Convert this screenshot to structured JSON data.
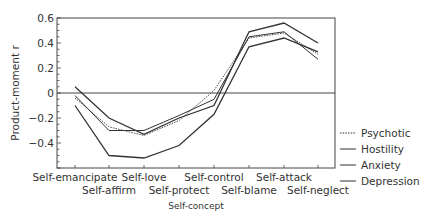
{
  "chart_data": {
    "type": "line",
    "title": "",
    "xlabel": "Self-concept",
    "ylabel": "Product-moment r",
    "ylim": [
      -0.6,
      0.6
    ],
    "yticks": [
      0.6,
      0.4,
      0.2,
      0,
      -0.2,
      -0.4
    ],
    "ytick_labels": [
      "0.6",
      "0.4",
      "0.2",
      "0",
      "−0.2",
      "−0.4"
    ],
    "grid": false,
    "zero_line": true,
    "legend_position": "right",
    "categories": [
      "Self-emancipate",
      "Self-affirm",
      "Self-love",
      "Self-protect",
      "Self-control",
      "Self-blame",
      "Self-attack",
      "Self-neglect"
    ],
    "series": [
      {
        "name": "Psychotic",
        "style": "dotted",
        "values": [
          -0.04,
          -0.27,
          -0.34,
          -0.22,
          0.02,
          0.44,
          0.48,
          0.31
        ]
      },
      {
        "name": "Hostility",
        "style": "solid",
        "values": [
          0.05,
          -0.2,
          -0.33,
          -0.2,
          -0.1,
          0.49,
          0.56,
          0.4
        ]
      },
      {
        "name": "Anxiety",
        "style": "solid",
        "values": [
          -0.02,
          -0.3,
          -0.3,
          -0.18,
          -0.05,
          0.45,
          0.49,
          0.27
        ]
      },
      {
        "name": "Depression",
        "style": "solid",
        "values": [
          -0.1,
          -0.5,
          -0.52,
          -0.42,
          -0.17,
          0.37,
          0.44,
          0.33
        ]
      }
    ]
  }
}
